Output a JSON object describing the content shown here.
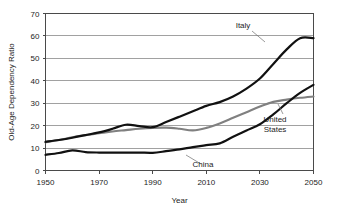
{
  "chart_data": {
    "type": "line",
    "title": "",
    "xlabel": "Year",
    "ylabel": "Old-Age Dependency Ratio",
    "xlim": [
      1950,
      2050
    ],
    "ylim": [
      0,
      70
    ],
    "xticks": [
      "1950",
      "1970",
      "1990",
      "2010",
      "2030",
      "2050"
    ],
    "xtick_values": [
      1950,
      1970,
      1990,
      2010,
      2030,
      2050
    ],
    "yticks": [
      "0",
      "10",
      "20",
      "30",
      "40",
      "50",
      "60",
      "70"
    ],
    "ytick_values": [
      0,
      10,
      20,
      30,
      40,
      50,
      60,
      70
    ],
    "grid": "horizontal",
    "legend_position": "inline-annotations",
    "x": [
      1950,
      1955,
      1960,
      1965,
      1970,
      1975,
      1980,
      1985,
      1990,
      1995,
      2000,
      2005,
      2010,
      2015,
      2020,
      2025,
      2030,
      2035,
      2040,
      2045,
      2050
    ],
    "series": [
      {
        "name": "Italy",
        "color": "#111111",
        "width": 2.2,
        "values": [
          12.8,
          13.6,
          14.6,
          15.8,
          17.0,
          18.6,
          20.4,
          19.8,
          19.3,
          21.6,
          24.0,
          26.4,
          28.8,
          30.5,
          33.0,
          36.5,
          41.0,
          47.5,
          54.0,
          59.0,
          59.0
        ]
      },
      {
        "name": "United States",
        "color": "#808080",
        "width": 2.1,
        "values": [
          12.6,
          13.6,
          14.8,
          15.8,
          16.6,
          17.4,
          18.0,
          18.6,
          19.0,
          19.1,
          18.6,
          17.9,
          19.0,
          21.0,
          23.5,
          26.0,
          28.5,
          30.6,
          31.6,
          32.4,
          33.0
        ]
      },
      {
        "name": "China",
        "color": "#111111",
        "width": 2.2,
        "values": [
          7.0,
          7.8,
          9.0,
          8.2,
          8.0,
          8.0,
          8.0,
          8.0,
          7.9,
          8.6,
          9.4,
          10.4,
          11.3,
          12.1,
          15.0,
          17.8,
          20.6,
          25.0,
          30.0,
          34.6,
          38.2
        ]
      }
    ],
    "annotations": [
      {
        "label": "Italy",
        "label_lines": [
          "Italy"
        ],
        "label_x": 243,
        "label_y": 28,
        "leader_from_x": 252,
        "leader_from_y": 31,
        "leader_to_x": 265,
        "leader_to_y": 42
      },
      {
        "label": "United States",
        "label_lines": [
          "United",
          "States"
        ],
        "label_x": 275,
        "label_y": 122,
        "leader_from_x": 283,
        "leader_from_y": 114,
        "leader_to_x": 278,
        "leader_to_y": 104
      },
      {
        "label": "China",
        "label_lines": [
          "China"
        ],
        "label_x": 203,
        "label_y": 167,
        "leader_from_x": 201,
        "leader_from_y": 164,
        "leader_to_x": 186,
        "leader_to_y": 155
      }
    ]
  }
}
